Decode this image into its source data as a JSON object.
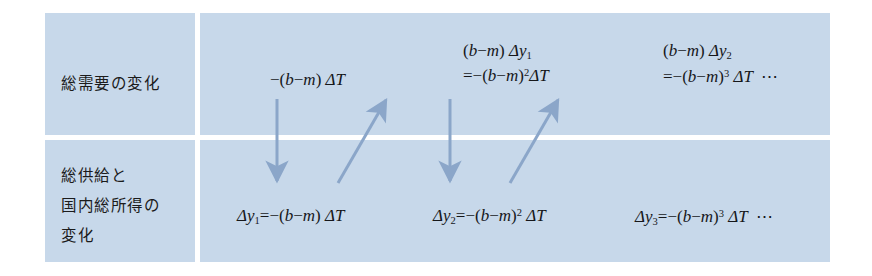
{
  "figure": {
    "title": "",
    "panel_color": "#c7d8ea",
    "text_color": "#16171a",
    "arrow_color": "#8ba6c9",
    "rows": [
      {
        "id": "aggregate-demand",
        "label_lines": [
          "総需要の変化"
        ],
        "cells": [
          {
            "id": "ad-term-1",
            "line1": "",
            "line2_prefix": "",
            "formula": "−(b−m) ΔT",
            "trailing": ""
          },
          {
            "id": "ad-term-2",
            "line1": "(b−m) Δy₁",
            "formula": "=−(b−m)² ΔT",
            "trailing": ""
          },
          {
            "id": "ad-term-3",
            "line1": "(b−m) Δy₂",
            "formula": "=−(b−m)³ ΔT",
            "trailing": "⋯"
          }
        ]
      },
      {
        "id": "aggregate-supply-and-gdi",
        "label_lines": [
          "総供給と",
          "国内総所得の",
          "変化"
        ],
        "cells": [
          {
            "id": "as-term-1",
            "formula": "Δy₁=−(b−m) ΔT",
            "trailing": ""
          },
          {
            "id": "as-term-2",
            "formula": "Δy₂=−(b−m)² ΔT",
            "trailing": ""
          },
          {
            "id": "as-term-3",
            "formula": "Δy₃=−(b−m)³ ΔT",
            "trailing": "⋯"
          }
        ]
      }
    ],
    "math_tokens": {
      "minus": "−",
      "b": "b",
      "m": "m",
      "delta_T": "ΔT",
      "delta_y": "Δy",
      "equals": "=",
      "open_paren": "(",
      "close_paren": ")",
      "exp2": "2",
      "exp3": "3",
      "sub1": "1",
      "sub2": "2",
      "sub3": "3",
      "ellipsis": "⋯"
    },
    "arrows": [
      {
        "id": "arrow-down-1",
        "direction": "down",
        "from": [
          277,
          99
        ],
        "to": [
          277,
          181
        ]
      },
      {
        "id": "arrow-up-1",
        "direction": "up-right",
        "from": [
          338,
          183
        ],
        "to": [
          386,
          100
        ]
      },
      {
        "id": "arrow-down-2",
        "direction": "down",
        "from": [
          450,
          99
        ],
        "to": [
          450,
          181
        ]
      },
      {
        "id": "arrow-up-2",
        "direction": "up-right",
        "from": [
          510,
          183
        ],
        "to": [
          558,
          100
        ]
      }
    ]
  }
}
